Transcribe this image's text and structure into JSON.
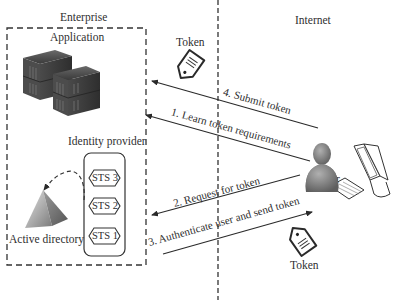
{
  "zones": {
    "enterprise": "Enterprise",
    "internet": "Internet"
  },
  "enterprise": {
    "application_label": "Application",
    "identity_provider_label": "Identity provider",
    "sts_items": [
      {
        "label": "STS 3"
      },
      {
        "label": "STS 2"
      },
      {
        "label": "STS 1"
      }
    ],
    "active_directory_label": "Active directory"
  },
  "internet": {
    "user_label": "User"
  },
  "tokens": {
    "top_label": "Token",
    "bottom_label": "Token"
  },
  "steps": [
    {
      "id": 1,
      "label": "1. Learn token requirements",
      "direction": "user-to-application"
    },
    {
      "id": 2,
      "label": "2. Request for token",
      "direction": "user-to-identity-provider"
    },
    {
      "id": 3,
      "label": "3. Authenticate user and send token",
      "direction": "identity-provider-to-user"
    },
    {
      "id": 4,
      "label": "4. Submit token",
      "direction": "user-to-application"
    }
  ],
  "icons": {
    "server": "server-rack-icon",
    "token": "token-tag-icon",
    "pyramid": "active-directory-pyramid-icon",
    "user": "user-person-icon",
    "computer": "desktop-computer-icon"
  },
  "colors": {
    "line": "#2a2a2a",
    "server_dark": "#3c3c3c",
    "person": "#7d7d7d",
    "pyramid": "#8a8a8a"
  }
}
